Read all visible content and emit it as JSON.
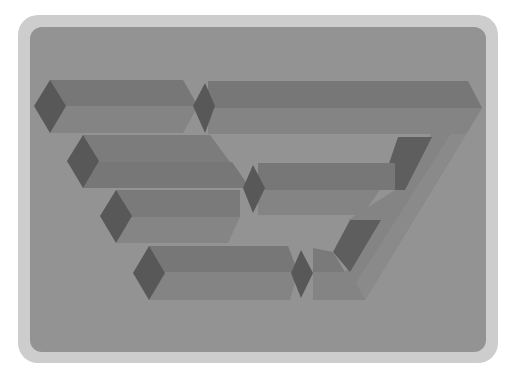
{
  "illustration": {
    "title": "",
    "description": "Impossible figure of interlocking rectangular bars",
    "colors": {
      "frame": "#cdcdcd",
      "panel": "#939393",
      "top_face": "#777777",
      "front_face": "#848484",
      "end_cap": "#585858",
      "inner_shadow": "#5e5e5e"
    }
  }
}
